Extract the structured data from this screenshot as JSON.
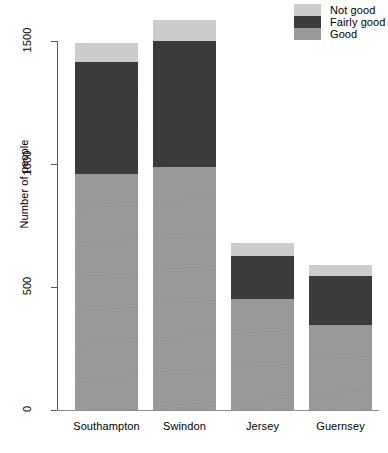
{
  "chart_data": {
    "type": "bar",
    "subtype": "stacked",
    "title": "",
    "xlabel": "",
    "ylabel": "Number of people",
    "categories": [
      "Southampton",
      "Swindon",
      "Jersey",
      "Guernsey"
    ],
    "series": [
      {
        "name": "Good",
        "color": "#999999",
        "values": [
          959,
          988,
          451,
          346
        ]
      },
      {
        "name": "Fairly good",
        "color": "#3b3b3b",
        "values": [
          455,
          512,
          175,
          199
        ]
      },
      {
        "name": "Not good",
        "color": "#cccccc",
        "values": [
          77,
          85,
          53,
          45
        ]
      }
    ],
    "totals": [
      1491,
      1585,
      679,
      590
    ],
    "ylim": [
      0,
      1620
    ],
    "yticks": [
      0,
      500,
      1000,
      1500
    ],
    "ytick_labels": [
      "0",
      "500",
      "1000",
      "1500"
    ],
    "grid": false,
    "legend_position": "top-right",
    "legend_order": [
      "Not good",
      "Fairly good",
      "Good"
    ]
  },
  "legend": {
    "items": [
      {
        "label": "Not good",
        "color": "#cccccc"
      },
      {
        "label": "Fairly good",
        "color": "#3b3b3b"
      },
      {
        "label": "Good",
        "color": "#999999"
      }
    ]
  },
  "axes": {
    "y_title": "Number of people",
    "y_tick_labels": [
      "1500",
      "1000",
      "500",
      "0"
    ],
    "x_tick_labels": [
      "Southampton",
      "Swindon",
      "Jersey",
      "Guernsey"
    ]
  },
  "colors": {
    "good": "#999999",
    "fairly_good": "#3b3b3b",
    "not_good": "#cccccc",
    "axis": "#5b5b5b",
    "background": "#ffffff"
  }
}
